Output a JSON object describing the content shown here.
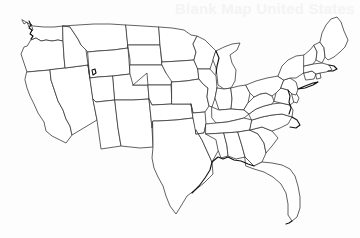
{
  "figure": {
    "watermark": "Blank Map United States",
    "background_color": "#fdfdfd",
    "state_fill_color": "#ffffff",
    "state_border_color": "#3a3a3a",
    "coastline_color": "#111111",
    "map_kind": "blank-outline-map",
    "region": "Contiguous United States",
    "state_count": "48",
    "labels_shown": "none",
    "width_px": "360",
    "height_px": "238"
  },
  "map": {
    "states": [
      {
        "code": "WA",
        "name": "Washington",
        "d": "M22,20 L24,24 L27,22 L29,27 L31,24 L33,30 L30,33 L33,36 L31,40 L36,38 L41,41 L46,40 L52,41 L58,40 L63,41 L63,26 L54,27 L44,27 L33,26 L26,22 Z"
      },
      {
        "code": "OR",
        "name": "Oregon",
        "d": "M31,40 L36,38 L41,41 L46,40 L52,41 L58,40 L63,41 L64,57 L65,68 L50,70 L38,71 L27,72 L24,63 L21,54 L24,47 L27,46 Z"
      },
      {
        "code": "CA",
        "name": "California",
        "d": "M27,72 L38,71 L50,70 L51,80 L55,92 L58,101 L63,110 L66,119 L70,126 L72,135 L66,143 L60,140 L52,136 L46,131 L44,122 L38,113 L34,104 L30,96 L27,88 L25,80 Z"
      },
      {
        "code": "NV",
        "name": "Nevada",
        "d": "M65,68 L88,65 L93,99 L97,120 L72,135 L70,126 L66,119 L63,110 L58,101 L55,92 L51,80 L50,70 Z"
      },
      {
        "code": "ID",
        "name": "Idaho",
        "d": "M63,26 L70,27 L74,33 L78,39 L81,45 L86,50 L88,65 L65,68 L64,57 L63,41 Z"
      },
      {
        "code": "MT",
        "name": "Montana",
        "d": "M63,26 L78,25 L94,24 L110,24 L126,25 L128,48 L113,50 L98,51 L88,52 L86,50 L81,45 L78,39 L74,33 L70,27 Z"
      },
      {
        "code": "WY",
        "name": "Wyoming",
        "d": "M88,52 L98,51 L113,50 L128,48 L130,74 L113,76 L98,77 L90,78 Z"
      },
      {
        "code": "UT",
        "name": "Utah",
        "d": "M88,65 L90,78 L98,77 L113,76 L115,100 L96,102 L93,99 Z"
      },
      {
        "code": "CO",
        "name": "Colorado",
        "d": "M113,76 L130,74 L147,73 L149,99 L133,100 L115,100 Z"
      },
      {
        "code": "AZ",
        "name": "Arizona",
        "d": "M93,99 L96,102 L115,100 L118,128 L121,146 L101,149 L97,120 Z"
      },
      {
        "code": "NM",
        "name": "New Mexico",
        "d": "M115,100 L133,100 L149,99 L152,128 L153,147 L140,148 L121,146 L118,128 Z"
      },
      {
        "code": "ND",
        "name": "North Dakota",
        "d": "M126,25 L143,26 L159,27 L160,45 L144,45 L128,45 L128,48 Z"
      },
      {
        "code": "SD",
        "name": "South Dakota",
        "d": "M128,45 L144,45 L160,45 L162,65 L146,65 L130,65 L130,60 Z"
      },
      {
        "code": "NE",
        "name": "Nebraska",
        "d": "M130,65 L146,65 L162,65 L166,73 L172,77 L171,85 L152,85 L133,85 L130,74 Z"
      },
      {
        "code": "KS",
        "name": "Kansas",
        "d": "M133,85 L152,85 L171,85 L172,104 L152,105 L149,99 L147,73 L133,85 Z"
      },
      {
        "code": "OK",
        "name": "Oklahoma",
        "d": "M149,99 L152,105 L172,104 L191,104 L193,118 L176,120 L158,121 L153,121 L152,128 L149,99 Z"
      },
      {
        "code": "TX",
        "name": "Texas",
        "d": "M153,121 L158,121 L176,120 L193,118 L196,130 L202,140 L207,151 L212,162 L213,174 L204,183 L195,190 L187,196 L181,206 L176,214 L170,206 L166,196 L163,186 L158,177 L154,168 L152,158 L153,147 Z"
      },
      {
        "code": "MN",
        "name": "Minnesota",
        "d": "M159,27 L172,28 L184,30 L191,35 L197,36 L193,44 L196,52 L194,60 L180,61 L162,62 L160,45 Z"
      },
      {
        "code": "IA",
        "name": "Iowa",
        "d": "M162,62 L180,61 L194,60 L198,69 L199,79 L186,81 L172,82 L166,73 L162,65 Z"
      },
      {
        "code": "MO",
        "name": "Missouri",
        "d": "M172,82 L186,81 L199,79 L203,84 L208,88 L207,97 L209,106 L205,112 L193,113 L191,104 L172,104 Z"
      },
      {
        "code": "AR",
        "name": "Arkansas",
        "d": "M191,104 L193,113 L205,112 L206,124 L204,133 L196,134 L193,118 Z"
      },
      {
        "code": "LA",
        "name": "Louisiana",
        "d": "M196,134 L204,133 L206,124 L216,125 L218,136 L221,146 L217,153 L212,162 L207,151 L202,140 L196,130 Z"
      },
      {
        "code": "WI",
        "name": "Wisconsin",
        "d": "M194,60 L196,52 L193,44 L197,36 L205,40 L211,46 L216,51 L213,60 L210,69 L198,69 Z"
      },
      {
        "code": "IL",
        "name": "Illinois",
        "d": "M198,69 L210,69 L216,76 L217,88 L215,98 L212,107 L209,106 L207,97 L208,88 L203,84 L199,79 Z"
      },
      {
        "code": "MI",
        "name": "Michigan",
        "d": "M216,51 L224,47 L232,44 L240,43 L237,50 L230,55 L232,63 L236,70 L235,81 L231,88 L224,89 L218,85 L217,76 L216,68 L213,60 Z"
      },
      {
        "code": "IN",
        "name": "Indiana",
        "d": "M217,88 L224,89 L231,88 L232,99 L231,109 L219,110 L215,98 L217,88 Z"
      },
      {
        "code": "OH",
        "name": "Ohio",
        "d": "M231,88 L239,86 L246,85 L250,93 L248,103 L244,110 L231,109 L232,99 Z"
      },
      {
        "code": "KY",
        "name": "Kentucky",
        "d": "M212,107 L219,110 L231,109 L244,110 L249,114 L244,118 L236,120 L227,122 L216,123 L212,118 Z"
      },
      {
        "code": "TN",
        "name": "Tennessee",
        "d": "M206,124 L216,123 L227,122 L236,120 L244,118 L252,120 L250,130 L238,132 L224,133 L206,134 Z"
      },
      {
        "code": "MS",
        "name": "Mississippi",
        "d": "M206,134 L224,133 L227,146 L228,156 L221,158 L218,150 L216,140 Z"
      },
      {
        "code": "AL",
        "name": "Alabama",
        "d": "M224,133 L238,132 L242,146 L245,157 L236,159 L228,156 L227,146 Z"
      },
      {
        "code": "GA",
        "name": "Georgia",
        "d": "M238,132 L250,130 L258,134 L264,143 L266,153 L262,162 L254,166 L245,157 L242,146 Z"
      },
      {
        "code": "FL",
        "name": "Florida",
        "d": "M245,157 L254,166 L262,162 L272,163 L282,165 L290,169 L295,176 L298,186 L300,197 L300,208 L297,217 L292,221 L288,215 L288,204 L286,193 L281,184 L273,177 L264,172 L254,169 L246,166 Z"
      },
      {
        "code": "SC",
        "name": "South Carolina",
        "d": "M250,130 L262,127 L272,131 L278,138 L272,146 L266,153 L264,143 L258,134 Z"
      },
      {
        "code": "NC",
        "name": "North Carolina",
        "d": "M252,120 L262,117 L272,115 L282,114 L292,117 L288,124 L280,128 L272,131 L262,127 L250,130 Z"
      },
      {
        "code": "VA",
        "name": "Virginia",
        "d": "M249,114 L256,109 L264,106 L272,104 L281,103 L290,105 L293,110 L292,117 L282,114 L272,115 L262,117 L252,120 Z"
      },
      {
        "code": "WV",
        "name": "West Virginia",
        "d": "M248,103 L254,97 L260,94 L266,93 L272,96 L274,101 L272,104 L264,106 L256,109 L249,114 L244,110 Z"
      },
      {
        "code": "PA",
        "name": "Pennsylvania",
        "d": "M246,85 L256,81 L267,78 L278,76 L284,80 L281,88 L276,93 L272,96 L266,93 L260,94 L254,97 L250,93 Z"
      },
      {
        "code": "MD",
        "name": "Maryland",
        "d": "M274,101 L276,93 L281,88 L288,90 L292,94 L296,97 L294,102 L290,105 L281,103 Z"
      },
      {
        "code": "DE",
        "name": "Delaware",
        "d": "M292,94 L296,93 L299,98 L297,103 L294,102 Z"
      },
      {
        "code": "NJ",
        "name": "New Jersey",
        "d": "M284,80 L290,78 L296,82 L298,89 L296,95 L292,94 L288,90 L281,88 Z"
      },
      {
        "code": "NY",
        "name": "New York",
        "d": "M278,76 L282,66 L288,60 L296,56 L304,55 L310,58 L312,64 L308,70 L302,74 L296,78 L290,78 L284,80 Z"
      },
      {
        "code": "CT",
        "name": "Connecticut",
        "d": "M304,73 L312,71 L316,74 L314,79 L306,80 Z"
      },
      {
        "code": "RI",
        "name": "Rhode Island",
        "d": "M316,74 L320,73 L321,78 L317,79 Z"
      },
      {
        "code": "MA",
        "name": "Massachusetts",
        "d": "M304,66 L313,64 L322,63 L329,65 L332,70 L326,72 L320,73 L316,74 L312,71 L304,73 Z"
      },
      {
        "code": "VT",
        "name": "Vermont",
        "d": "M304,55 L310,50 L314,45 L317,52 L316,60 L313,64 L304,66 Z"
      },
      {
        "code": "NH",
        "name": "New Hampshire",
        "d": "M314,45 L320,42 L324,48 L325,57 L322,63 L316,60 L317,52 Z"
      },
      {
        "code": "ME",
        "name": "Maine",
        "d": "M320,42 L322,33 L326,25 L331,19 L337,17 L341,22 L344,31 L348,40 L345,47 L340,52 L334,57 L328,60 L325,57 L324,48 Z"
      }
    ],
    "coast_details": [
      {
        "name": "puget-sound-detail",
        "d": "M29,21 L31,25 L29,28 L32,30 L30,34 L33,36 L31,39"
      },
      {
        "name": "cape-cod-detail",
        "d": "M329,65 L334,66 L337,69 L333,71 L328,71"
      },
      {
        "name": "long-island-detail",
        "d": "M298,89 L305,86 L313,83 L318,82 L313,85 L305,88 Z"
      },
      {
        "name": "chesapeake-detail",
        "d": "M288,90 L290,96 L289,102 L291,108 L289,114"
      },
      {
        "name": "outer-banks-detail",
        "d": "M292,117 L297,120 L300,125 L296,128 L290,127"
      },
      {
        "name": "great-salt-lake",
        "d": "M92,70 L95,69 L96,73 L93,75 Z"
      },
      {
        "name": "lake-michigan-shore",
        "d": "M216,51 L219,58 L217,66 L216,74"
      },
      {
        "name": "gulf-coast-detail",
        "d": "M212,162 L218,157 L223,159 L228,157 L234,160 L241,161 L248,164 L254,166"
      },
      {
        "name": "texas-coast-detail",
        "d": "M212,162 L210,170 L205,178 L199,186 L192,193"
      },
      {
        "name": "florida-keys-detail",
        "d": "M292,221 L289,223 L286,224"
      }
    ]
  }
}
